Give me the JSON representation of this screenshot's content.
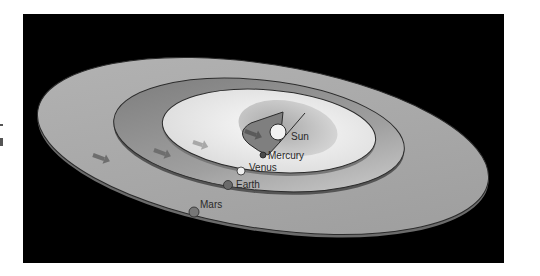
{
  "diagram": {
    "labels": {
      "sun": "Sun",
      "mercury": "Mercury",
      "venus": "Venus",
      "earth": "Earth",
      "mars": "Mars"
    },
    "colors": {
      "background": "#000000",
      "mars_disk": "#a9a9a9",
      "earth_disk": "#8f8f8f",
      "venus_disk": "#e6e6e6",
      "mercury_disk": "#7c7c7c",
      "sun": "#f2f2f2",
      "arrow": "#707070",
      "orbit_line": "#2b2b2b"
    },
    "direction_arrows": 4
  }
}
